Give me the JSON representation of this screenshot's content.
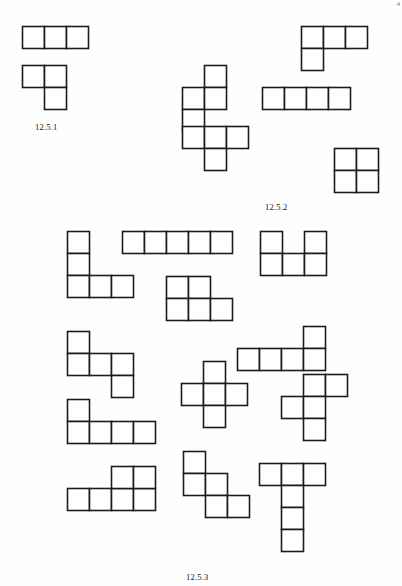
{
  "page": {
    "width": 402,
    "height": 586,
    "background_color": "#fefefe",
    "ink_color": "#1c1c1c",
    "corner_mark": "4"
  },
  "figures": [
    {
      "id": "fig-12-5-1",
      "caption": "12.5.1",
      "caption_x": 35,
      "caption_y": 122,
      "name": "trominoes",
      "cell_size": 22,
      "shapes": [
        {
          "name": "i-tromino",
          "x": 21,
          "y": 25,
          "cells": [
            [
              0,
              0
            ],
            [
              1,
              0
            ],
            [
              2,
              0
            ]
          ]
        },
        {
          "name": "l-tromino",
          "x": 21,
          "y": 64,
          "cells": [
            [
              0,
              0
            ],
            [
              1,
              0
            ],
            [
              1,
              1
            ]
          ]
        }
      ]
    },
    {
      "id": "fig-12-5-2",
      "caption": "12.5.2",
      "caption_x": 265,
      "caption_y": 202,
      "name": "tetrominoes",
      "cell_size": 22,
      "shapes": [
        {
          "name": "j-tetromino",
          "x": 300,
          "y": 25,
          "cells": [
            [
              0,
              0
            ],
            [
              1,
              0
            ],
            [
              2,
              0
            ],
            [
              0,
              1
            ]
          ]
        },
        {
          "name": "s-tetromino",
          "x": 181,
          "y": 64,
          "cells": [
            [
              1,
              0
            ],
            [
              0,
              1
            ],
            [
              1,
              1
            ],
            [
              0,
              2
            ]
          ]
        },
        {
          "name": "i-tetromino",
          "x": 261,
          "y": 86,
          "cells": [
            [
              0,
              0
            ],
            [
              1,
              0
            ],
            [
              2,
              0
            ],
            [
              3,
              0
            ]
          ]
        },
        {
          "name": "t-tetromino",
          "x": 181,
          "y": 125,
          "cells": [
            [
              0,
              0
            ],
            [
              1,
              0
            ],
            [
              2,
              0
            ],
            [
              1,
              1
            ]
          ]
        },
        {
          "name": "o-tetromino",
          "x": 333,
          "y": 147,
          "cells": [
            [
              0,
              0
            ],
            [
              1,
              0
            ],
            [
              0,
              1
            ],
            [
              1,
              1
            ]
          ]
        }
      ]
    },
    {
      "id": "fig-12-5-3",
      "caption": "12.5.3",
      "caption_x": 186,
      "caption_y": 572,
      "name": "pentominoes",
      "cell_size": 22,
      "shapes": [
        {
          "name": "v-pentomino",
          "x": 66,
          "y": 230,
          "cells": [
            [
              0,
              0
            ],
            [
              0,
              1
            ],
            [
              0,
              2
            ],
            [
              1,
              2
            ],
            [
              2,
              2
            ]
          ]
        },
        {
          "name": "i-pentomino",
          "x": 121,
          "y": 230,
          "cells": [
            [
              0,
              0
            ],
            [
              1,
              0
            ],
            [
              2,
              0
            ],
            [
              3,
              0
            ],
            [
              4,
              0
            ]
          ]
        },
        {
          "name": "u-pentomino",
          "x": 259,
          "y": 230,
          "cells": [
            [
              0,
              0
            ],
            [
              2,
              0
            ],
            [
              0,
              1
            ],
            [
              1,
              1
            ],
            [
              2,
              1
            ]
          ]
        },
        {
          "name": "p-pentomino",
          "x": 165,
          "y": 275,
          "cells": [
            [
              0,
              0
            ],
            [
              1,
              0
            ],
            [
              0,
              1
            ],
            [
              1,
              1
            ],
            [
              2,
              1
            ]
          ]
        },
        {
          "name": "w-pentomino",
          "x": 66,
          "y": 330,
          "cells": [
            [
              0,
              0
            ],
            [
              0,
              1
            ],
            [
              1,
              1
            ],
            [
              2,
              1
            ],
            [
              2,
              2
            ]
          ]
        },
        {
          "name": "l-pentomino-left",
          "x": 236,
          "y": 325,
          "cells": [
            [
              3,
              0
            ],
            [
              0,
              1
            ],
            [
              1,
              1
            ],
            [
              2,
              1
            ],
            [
              3,
              1
            ]
          ]
        },
        {
          "name": "plus-pentomino",
          "x": 180,
          "y": 360,
          "cells": [
            [
              1,
              0
            ],
            [
              0,
              1
            ],
            [
              1,
              1
            ],
            [
              2,
              1
            ],
            [
              1,
              2
            ]
          ]
        },
        {
          "name": "t-pentomino-right",
          "x": 280,
          "y": 373,
          "cells": [
            [
              1,
              0
            ],
            [
              2,
              0
            ],
            [
              0,
              1
            ],
            [
              1,
              1
            ],
            [
              1,
              2
            ]
          ]
        },
        {
          "name": "l-pentomino",
          "x": 66,
          "y": 398,
          "cells": [
            [
              0,
              0
            ],
            [
              0,
              1
            ],
            [
              1,
              1
            ],
            [
              2,
              1
            ],
            [
              3,
              1
            ]
          ]
        },
        {
          "name": "n-pentomino",
          "x": 182,
          "y": 450,
          "cells": [
            [
              0,
              0
            ],
            [
              0,
              1
            ],
            [
              1,
              1
            ],
            [
              1,
              2
            ],
            [
              2,
              2
            ]
          ]
        },
        {
          "name": "t-pentomino",
          "x": 258,
          "y": 462,
          "cells": [
            [
              0,
              0
            ],
            [
              1,
              0
            ],
            [
              2,
              0
            ],
            [
              1,
              1
            ],
            [
              1,
              2
            ],
            [
              1,
              3
            ]
          ]
        },
        {
          "name": "y-pentomino",
          "x": 66,
          "y": 487,
          "cells": [
            [
              0,
              0
            ],
            [
              1,
              0
            ],
            [
              2,
              0
            ],
            [
              3,
              0
            ]
          ]
        },
        {
          "name": "z-pentomino-tail",
          "x": 110,
          "y": 465,
          "cells": [
            [
              0,
              0
            ],
            [
              1,
              0
            ]
          ]
        }
      ]
    }
  ]
}
